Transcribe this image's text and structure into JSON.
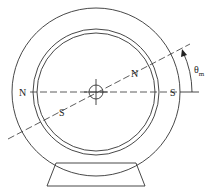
{
  "diagram": {
    "labels": {
      "stator_north": "N",
      "stator_south": "S",
      "rotor_north": "N",
      "rotor_south": "S",
      "angle_symbol": "θ",
      "angle_subscript": "m"
    },
    "colors": {
      "line": "#333333",
      "background": "#ffffff"
    }
  }
}
